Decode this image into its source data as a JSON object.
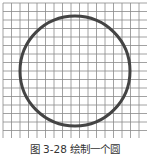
{
  "figure": {
    "caption": "图 3-28  绘制一个圆",
    "grid": {
      "x0": 3,
      "y0": 3,
      "x1": 147,
      "y1": 138,
      "step": 8.5,
      "color": "#8a8a8a"
    },
    "circle": {
      "cx": 75,
      "cy": 71,
      "r": 55,
      "stroke": "#444444",
      "stroke_width": 3
    }
  }
}
